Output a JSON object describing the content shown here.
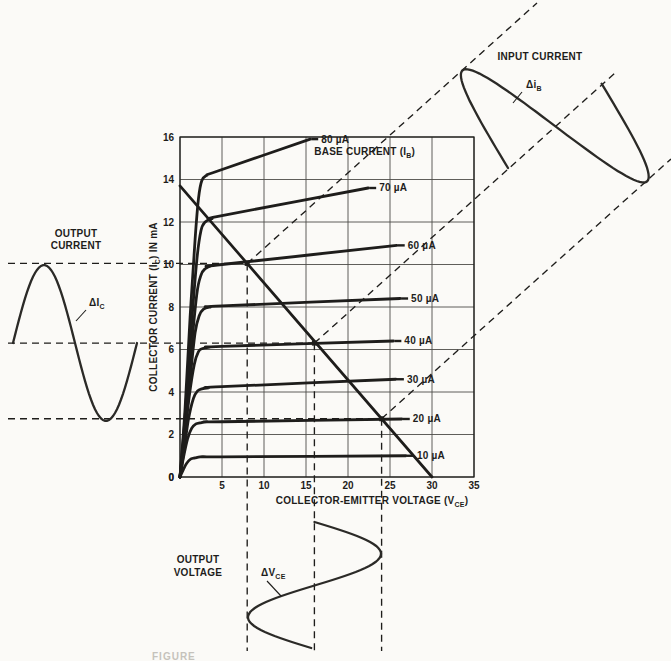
{
  "figure": {
    "caption_fragment": "FIGURE",
    "background": "#fbfaf7",
    "ink": "#1e1d1b"
  },
  "chart_data": {
    "type": "line",
    "x_axis": {
      "label_pre": "COLLECTOR-EMITTER VOLTAGE (V",
      "label_sub": "CE",
      "label_post": ")",
      "min": 0,
      "max": 35,
      "ticks": [
        5,
        10,
        15,
        20,
        25,
        30,
        35
      ],
      "grid_step": 5,
      "origin_label": "0"
    },
    "y_axis": {
      "label_pre": "COLLECTOR CURRENT (I",
      "label_sub": "C",
      "label_post": ") IN mA",
      "min": 0,
      "max": 16,
      "ticks": [
        16,
        14,
        12,
        10,
        8,
        6,
        4,
        2,
        0
      ],
      "grid_step": 2
    },
    "family_label": {
      "pre": "BASE CURRENT (I",
      "sub": "B",
      "post": ")"
    },
    "curves": [
      {
        "label": "80 µA",
        "points": [
          [
            0,
            0
          ],
          [
            0.6,
            3.2
          ],
          [
            1.2,
            7.5
          ],
          [
            1.8,
            11.2
          ],
          [
            2.2,
            13.1
          ],
          [
            2.6,
            13.95
          ],
          [
            3.2,
            14.2
          ],
          [
            4.5,
            14.4
          ],
          [
            15.5,
            15.9
          ]
        ]
      },
      {
        "label": "70 µA",
        "points": [
          [
            0,
            0
          ],
          [
            0.6,
            2.8
          ],
          [
            1.3,
            6.8
          ],
          [
            2.0,
            10.2
          ],
          [
            2.5,
            11.6
          ],
          [
            3.0,
            12.0
          ],
          [
            3.8,
            12.15
          ],
          [
            5.0,
            12.3
          ],
          [
            22.4,
            13.6
          ]
        ]
      },
      {
        "label": "60 µA",
        "points": [
          [
            0,
            0
          ],
          [
            0.6,
            2.4
          ],
          [
            1.3,
            5.8
          ],
          [
            2.0,
            8.6
          ],
          [
            2.5,
            9.5
          ],
          [
            3.0,
            9.8
          ],
          [
            3.8,
            9.95
          ],
          [
            5.0,
            10.0
          ],
          [
            25.8,
            10.9
          ]
        ]
      },
      {
        "label": "50 µA",
        "points": [
          [
            0,
            0
          ],
          [
            0.6,
            2.1
          ],
          [
            1.2,
            4.6
          ],
          [
            1.8,
            6.8
          ],
          [
            2.3,
            7.6
          ],
          [
            2.8,
            7.9
          ],
          [
            3.6,
            8.0
          ],
          [
            5.0,
            8.05
          ],
          [
            26.2,
            8.4
          ]
        ]
      },
      {
        "label": "40 µA",
        "points": [
          [
            0,
            0
          ],
          [
            0.5,
            1.7
          ],
          [
            1.1,
            3.8
          ],
          [
            1.7,
            5.3
          ],
          [
            2.2,
            5.9
          ],
          [
            2.7,
            6.05
          ],
          [
            3.5,
            6.1
          ],
          [
            5.0,
            6.15
          ],
          [
            25.4,
            6.4
          ]
        ]
      },
      {
        "label": "30 µA",
        "points": [
          [
            0,
            0
          ],
          [
            0.5,
            1.3
          ],
          [
            1.0,
            2.7
          ],
          [
            1.6,
            3.7
          ],
          [
            2.1,
            4.05
          ],
          [
            2.6,
            4.15
          ],
          [
            3.4,
            4.2
          ],
          [
            5.0,
            4.25
          ],
          [
            25.7,
            4.6
          ]
        ]
      },
      {
        "label": "20 µA",
        "points": [
          [
            0,
            0
          ],
          [
            0.4,
            0.9
          ],
          [
            0.9,
            1.8
          ],
          [
            1.4,
            2.3
          ],
          [
            1.9,
            2.5
          ],
          [
            2.4,
            2.55
          ],
          [
            3.2,
            2.6
          ],
          [
            5.0,
            2.6
          ],
          [
            26.4,
            2.73
          ]
        ]
      },
      {
        "label": "10 µA",
        "points": [
          [
            0,
            0
          ],
          [
            0.4,
            0.35
          ],
          [
            0.8,
            0.65
          ],
          [
            1.3,
            0.85
          ],
          [
            1.8,
            0.9
          ],
          [
            2.4,
            0.95
          ],
          [
            3.2,
            0.95
          ],
          [
            5.0,
            0.95
          ],
          [
            26.9,
            1.0
          ]
        ]
      }
    ],
    "load_line": {
      "from": [
        0,
        13.7
      ],
      "to": [
        30,
        0
      ]
    },
    "operating_points": [
      {
        "vce": 8,
        "ic": 10.05
      },
      {
        "vce": 16,
        "ic": 6.3
      },
      {
        "vce": 24,
        "ic": 2.74
      }
    ]
  },
  "waveforms": {
    "output_current": {
      "title_line1": "OUTPUT",
      "title_line2": "CURRENT",
      "delta": {
        "pre": "ΔI",
        "sub": "C"
      }
    },
    "input_current": {
      "title": "INPUT CURRENT",
      "delta": {
        "pre": "Δi",
        "sub": "B"
      }
    },
    "output_voltage": {
      "title_line1": "OUTPUT",
      "title_line2": "VOLTAGE",
      "delta": {
        "pre": "ΔV",
        "sub": "CE"
      }
    }
  }
}
